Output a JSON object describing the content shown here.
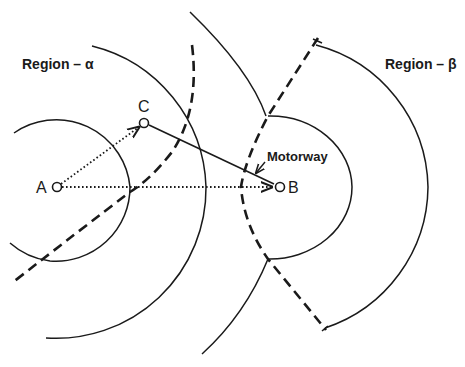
{
  "diagram": {
    "regions": [
      {
        "id": "alpha",
        "label": "Region – α"
      },
      {
        "id": "beta",
        "label": "Region – β"
      }
    ],
    "points": [
      {
        "id": "A",
        "label": "A"
      },
      {
        "id": "B",
        "label": "B"
      },
      {
        "id": "C",
        "label": "C"
      }
    ],
    "annotations": {
      "motorway": "Motorway"
    },
    "edges": [
      {
        "from": "A",
        "to": "C",
        "style": "dotted-arrow"
      },
      {
        "from": "A",
        "to": "B",
        "style": "dotted-arrow"
      },
      {
        "from": "C",
        "to": "B",
        "style": "solid"
      }
    ],
    "colors": {
      "ink": "#1a1a1a",
      "background": "#ffffff"
    }
  }
}
